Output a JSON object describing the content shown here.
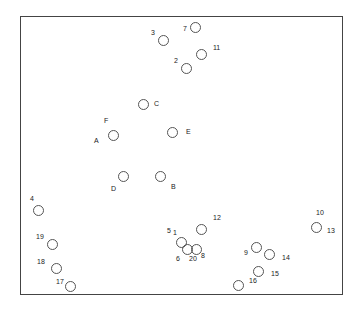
{
  "diagram": {
    "type": "scatter-layout",
    "frame": {
      "x": 20,
      "y": 16,
      "w": 323,
      "h": 279
    },
    "nodes": [
      {
        "id": "n7",
        "cx": 195,
        "cy": 27
      },
      {
        "id": "n3",
        "cx": 163,
        "cy": 40
      },
      {
        "id": "n11",
        "cx": 201,
        "cy": 54
      },
      {
        "id": "n2",
        "cx": 186,
        "cy": 68
      },
      {
        "id": "nC",
        "cx": 143,
        "cy": 104
      },
      {
        "id": "nAF",
        "cx": 113,
        "cy": 135
      },
      {
        "id": "nE",
        "cx": 172,
        "cy": 132
      },
      {
        "id": "nD",
        "cx": 123,
        "cy": 176
      },
      {
        "id": "nB",
        "cx": 160,
        "cy": 176
      },
      {
        "id": "n4",
        "cx": 38,
        "cy": 210
      },
      {
        "id": "n12",
        "cx": 201,
        "cy": 229
      },
      {
        "id": "n1013",
        "cx": 316,
        "cy": 227
      },
      {
        "id": "n1",
        "cx": 181,
        "cy": 242
      },
      {
        "id": "n6",
        "cx": 187,
        "cy": 249
      },
      {
        "id": "n20",
        "cx": 196,
        "cy": 249
      },
      {
        "id": "n9",
        "cx": 256,
        "cy": 247
      },
      {
        "id": "n14",
        "cx": 269,
        "cy": 254
      },
      {
        "id": "n15",
        "cx": 258,
        "cy": 271
      },
      {
        "id": "n16",
        "cx": 238,
        "cy": 285
      },
      {
        "id": "n19",
        "cx": 52,
        "cy": 244
      },
      {
        "id": "n18",
        "cx": 56,
        "cy": 268
      },
      {
        "id": "n17",
        "cx": 70,
        "cy": 286
      }
    ],
    "labels": [
      {
        "text": "7",
        "x": 183,
        "y": 29
      },
      {
        "text": "3",
        "x": 151,
        "y": 33
      },
      {
        "text": "11",
        "x": 213,
        "y": 48
      },
      {
        "text": "2",
        "x": 174,
        "y": 61
      },
      {
        "text": "C",
        "x": 154,
        "y": 104
      },
      {
        "text": "F",
        "x": 104,
        "y": 121
      },
      {
        "text": "A",
        "x": 94,
        "y": 141
      },
      {
        "text": "E",
        "x": 186,
        "y": 132
      },
      {
        "text": "D",
        "x": 111,
        "y": 189
      },
      {
        "text": "B",
        "x": 171,
        "y": 187
      },
      {
        "text": "4",
        "x": 30,
        "y": 199
      },
      {
        "text": "12",
        "x": 213,
        "y": 218
      },
      {
        "text": "10",
        "x": 316,
        "y": 213
      },
      {
        "text": "13",
        "x": 327,
        "y": 231
      },
      {
        "text": "5",
        "x": 167,
        "y": 231
      },
      {
        "text": "1",
        "x": 173,
        "y": 233
      },
      {
        "text": "6",
        "x": 176,
        "y": 259
      },
      {
        "text": "20",
        "x": 189,
        "y": 259
      },
      {
        "text": "8",
        "x": 201,
        "y": 256
      },
      {
        "text": "9",
        "x": 244,
        "y": 253
      },
      {
        "text": "14",
        "x": 282,
        "y": 258
      },
      {
        "text": "15",
        "x": 271,
        "y": 274
      },
      {
        "text": "16",
        "x": 249,
        "y": 281
      },
      {
        "text": "19",
        "x": 36,
        "y": 237
      },
      {
        "text": "18",
        "x": 37,
        "y": 262
      },
      {
        "text": "17",
        "x": 56,
        "y": 282
      }
    ]
  }
}
